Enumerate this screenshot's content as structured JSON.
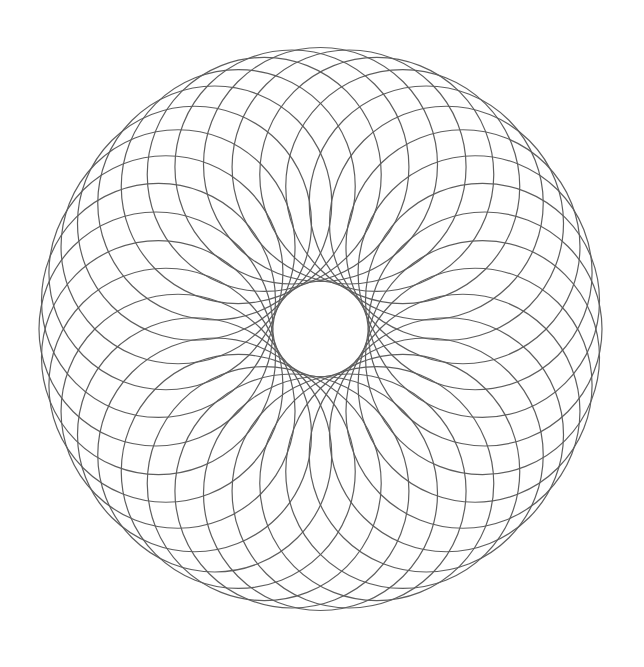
{
  "figure": {
    "type": "circle-rotation-torus",
    "width": 644,
    "height": 667,
    "background": "#ffffff",
    "center": {
      "x": 320.5,
      "y": 329
    },
    "circle_count": 36,
    "circle_radius": 117,
    "orbit_radius": 164.5,
    "outer_radius": 281.5,
    "inner_hole_radius": 47.5,
    "stroke_color": "#5e5e5e",
    "stroke_width": 1.2
  }
}
